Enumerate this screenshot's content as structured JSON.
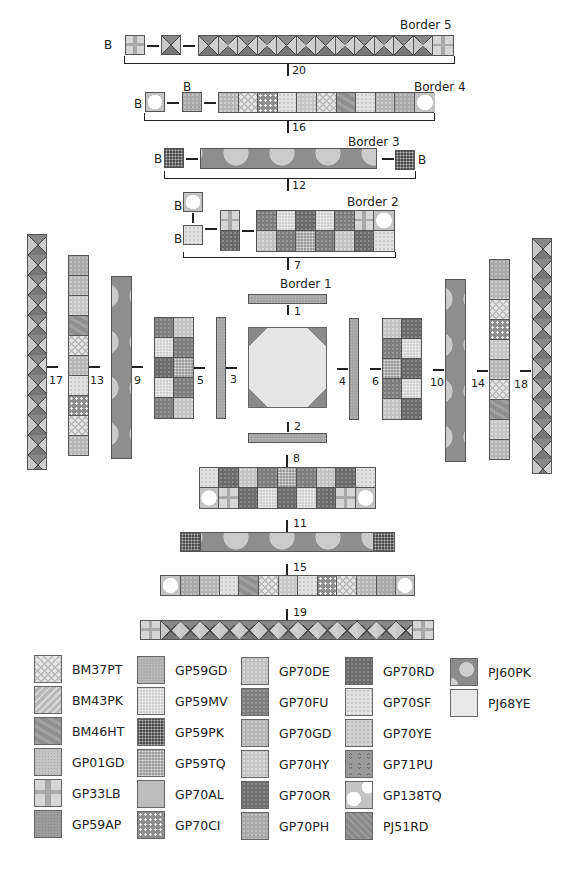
{
  "diagram": {
    "header_partial": "Quilt Assembly Diagram"
  },
  "block_label": "B",
  "borders": [
    {
      "name": "Border 1",
      "steps": [
        "1",
        "2",
        "3",
        "4"
      ]
    },
    {
      "name": "Border 2",
      "steps": [
        "5",
        "6",
        "7",
        "8"
      ]
    },
    {
      "name": "Border 3",
      "steps": [
        "9",
        "10",
        "11",
        "12"
      ]
    },
    {
      "name": "Border 4",
      "steps": [
        "13",
        "14",
        "15",
        "16"
      ]
    },
    {
      "name": "Border 5",
      "steps": [
        "17",
        "18",
        "19",
        "20"
      ]
    }
  ],
  "labels": {
    "border1": "Border 1",
    "border2": "Border 2",
    "border3": "Border 3",
    "border4": "Border 4",
    "border5": "Border 5",
    "s1": "1",
    "s2": "2",
    "s3": "3",
    "s4": "4",
    "s5": "5",
    "s6": "6",
    "s7": "7",
    "s8": "8",
    "s9": "9",
    "s10": "10",
    "s11": "11",
    "s12": "12",
    "s13": "13",
    "s14": "14",
    "s15": "15",
    "s16": "16",
    "s17": "17",
    "s18": "18",
    "s19": "19",
    "s20": "20",
    "b": "B"
  },
  "legend": {
    "columns": [
      [
        "BM37PT",
        "BM43PK",
        "BM46HT",
        "GP01GD",
        "GP33LB",
        "GP59AP"
      ],
      [
        "GP59GD",
        "GP59MV",
        "GP59PK",
        "GP59TQ",
        "GP70AL",
        "GP70CI"
      ],
      [
        "GP70DE",
        "GP70FU",
        "GP70GD",
        "GP70HY",
        "GP70OR",
        "GP70PH"
      ],
      [
        "GP70RD",
        "GP70SF",
        "GP70YE",
        "GP71PU",
        "GP138TQ",
        "PJ51RD"
      ],
      [
        "PJ60PK",
        "PJ68YE"
      ]
    ]
  }
}
